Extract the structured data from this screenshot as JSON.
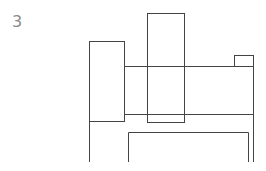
{
  "figure": {
    "label": "3",
    "stroke_color": "#444444",
    "shapes": [
      {
        "name": "left-box",
        "type": "rect",
        "x": 89.5,
        "y": 41.5,
        "w": 35,
        "h": 80
      },
      {
        "name": "tall-box",
        "type": "rect",
        "x": 147.5,
        "y": 13.5,
        "w": 37,
        "h": 109
      },
      {
        "name": "long-horizontal-bar",
        "type": "rect",
        "x": 124.5,
        "y": 66.5,
        "w": 129,
        "h": 48
      },
      {
        "name": "small-tab-box",
        "type": "rect",
        "x": 234.5,
        "y": 55.5,
        "w": 19,
        "h": 11
      },
      {
        "name": "left-extension-line",
        "type": "line",
        "x1": 89.5,
        "y1": 121.5,
        "x2": 89.5,
        "y2": 162
      },
      {
        "name": "right-extension-line",
        "type": "line",
        "x1": 253.5,
        "y1": 114.5,
        "x2": 253.5,
        "y2": 162
      },
      {
        "name": "bottom-open-frame",
        "type": "polyline",
        "points": "128.5,162 128.5,132.5 248.5,132.5 248.5,162"
      }
    ]
  }
}
